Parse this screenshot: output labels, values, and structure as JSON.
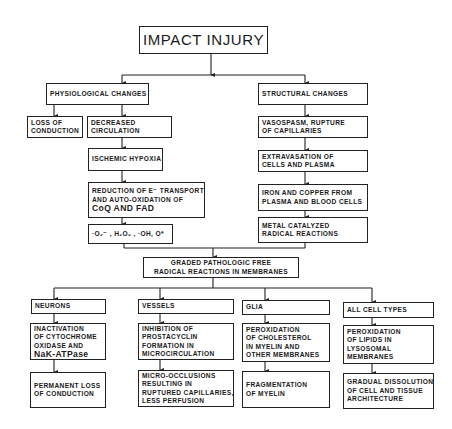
{
  "diagram": {
    "root": {
      "label": "IMPACT INJURY"
    },
    "physiological": {
      "header": "PHYSIOLOGICAL CHANGES",
      "loss_of_conduction": [
        "LOSS OF",
        "CONDUCTION"
      ],
      "decreased_circulation": [
        "DECREASED",
        "CIRCULATION"
      ],
      "ischemic_hypoxia": "ISCHEMIC HYPOXIA",
      "reduction": [
        "REDUCTION OF E⁻ TRANSPORT",
        "AND AUTO-OXIDATION OF",
        "CoQ AND FAD"
      ],
      "radicals": "·O₂⁻ , H₂O₂ , ·OH, O*"
    },
    "structural": {
      "header": "STRUCTURAL CHANGES",
      "vasospasm": [
        "VASOSPASM, RUPTURE",
        "OF CAPILLARIES"
      ],
      "extravasation": [
        "EXTRAVASATION OF",
        "CELLS AND PLASMA"
      ],
      "iron_copper": [
        "IRON AND COPPER FROM",
        "PLASMA AND BLOOD CELLS"
      ],
      "metal_catalyzed": [
        "METAL CATALYZED",
        "RADICAL REACTIONS"
      ]
    },
    "graded": [
      "GRADED PATHOLOGIC FREE",
      "RADICAL REACTIONS IN MEMBRANES"
    ],
    "targets": [
      {
        "header": "NEURONS",
        "effect": [
          "INACTIVATION",
          "OF CYTOCHROME",
          "OXIDASE AND",
          "NaK-ATPase"
        ],
        "outcome": [
          "PERMANENT LOSS",
          "OF CONDUCTION"
        ]
      },
      {
        "header": "VESSELS",
        "effect": [
          "INHIBITION OF",
          "PROSTACYCLIN",
          "FORMATION IN",
          "MICROCIRCULATION"
        ],
        "outcome": [
          "MICRO-OCCLUSIONS",
          "RESULTING IN",
          "RUPTURED CAPILLARIES,",
          "LESS PERFUSION"
        ]
      },
      {
        "header": "GLIA",
        "effect": [
          "PEROXIDATION",
          "OF CHOLESTEROL",
          "IN MYELIN AND",
          "OTHER MEMBRANES"
        ],
        "outcome": [
          "FRAGMENTATION",
          "OF MYELIN"
        ]
      },
      {
        "header": "ALL CELL TYPES",
        "effect": [
          "PEROXIDATION",
          "OF LIPIDS IN",
          "LYSOSOMAL",
          "MEMBRANES"
        ],
        "outcome": [
          "GRADUAL DISSOLUTION",
          "OF CELL AND TISSUE",
          "ARCHITECTURE"
        ]
      }
    ]
  },
  "colors": {
    "line": "#222222",
    "background": "#ffffff"
  }
}
